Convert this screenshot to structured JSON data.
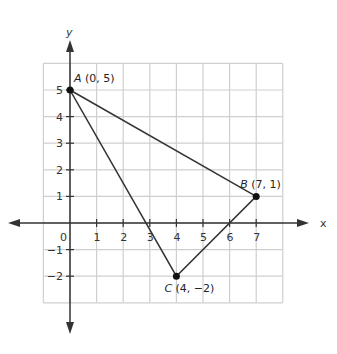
{
  "axes": {
    "x_label": "x",
    "y_label": "y",
    "origin_label": "0"
  },
  "x_ticks": [
    "1",
    "2",
    "3",
    "4",
    "5",
    "6",
    "7"
  ],
  "y_ticks": [
    "5",
    "4",
    "3",
    "2",
    "1",
    "−1",
    "−2"
  ],
  "points": [
    {
      "name": "A",
      "coords": "(0, 5)",
      "x": 0,
      "y": 5
    },
    {
      "name": "B",
      "coords": "(7, 1)",
      "x": 7,
      "y": 1
    },
    {
      "name": "C",
      "coords": "(4, −2)",
      "x": 4,
      "y": -2
    }
  ],
  "colors": {
    "grid": "#cfcfcf",
    "axis": "#333333",
    "line": "#333333"
  },
  "chart_data": {
    "type": "scatter",
    "title": "",
    "xlabel": "x",
    "ylabel": "y",
    "xlim": [
      -1,
      8
    ],
    "ylim": [
      -3,
      6
    ],
    "grid": true,
    "series": [
      {
        "name": "Triangle ABC",
        "x": [
          0,
          7,
          4,
          0
        ],
        "y": [
          5,
          1,
          -2,
          5
        ]
      }
    ],
    "annotations": [
      "A (0, 5)",
      "B (7, 1)",
      "C (4, −2)"
    ]
  }
}
